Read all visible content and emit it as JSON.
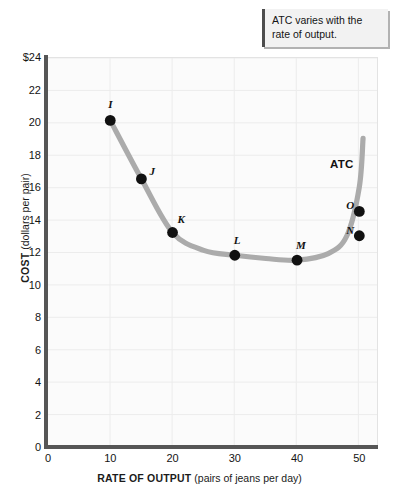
{
  "callout": {
    "text": "ATC varies with the rate of output."
  },
  "chart_data": {
    "type": "line",
    "title": "",
    "xlabel_strong": "RATE OF OUTPUT",
    "xlabel_rest": " (pairs of jeans per day)",
    "ylabel_strong": "COST",
    "ylabel_rest": " (dollars per pair)",
    "xlim": [
      0,
      53
    ],
    "ylim": [
      0,
      24
    ],
    "xticks": [
      "0",
      "10",
      "20",
      "30",
      "40",
      "50"
    ],
    "xtick_values": [
      0,
      10,
      20,
      30,
      40,
      50
    ],
    "yticks": [
      "$24",
      "22",
      "20",
      "18",
      "16",
      "14",
      "12",
      "10",
      "8",
      "6",
      "4",
      "2",
      "0"
    ],
    "ytick_values": [
      24,
      22,
      20,
      18,
      16,
      14,
      12,
      10,
      8,
      6,
      4,
      2,
      0
    ],
    "grid": true,
    "legend_position": "inline-curve-label",
    "series": [
      {
        "name": "ATC",
        "label": "ATC",
        "color": "#ababab",
        "points": [
          {
            "label": "I",
            "x": 10,
            "y": 20.1,
            "label_dx": -2,
            "label_dy": -14
          },
          {
            "label": "J",
            "x": 15,
            "y": 16.5,
            "label_dx": 8,
            "label_dy": -6
          },
          {
            "label": "K",
            "x": 20,
            "y": 13.2,
            "label_dx": 5,
            "label_dy": -12
          },
          {
            "label": "L",
            "x": 30,
            "y": 11.8,
            "label_dx": -1,
            "label_dy": -13
          },
          {
            "label": "M",
            "x": 40,
            "y": 11.5,
            "label_dx": -1,
            "label_dy": -13
          },
          {
            "label": "N",
            "x": 50,
            "y": 13.0,
            "label_dx": -13,
            "label_dy": -4
          },
          {
            "label": "O",
            "x": 50,
            "y": 14.5,
            "label_dx": -13,
            "label_dy": -4
          }
        ],
        "curve_path": [
          {
            "x": 10,
            "y": 20.1
          },
          {
            "x": 15,
            "y": 16.5
          },
          {
            "x": 20,
            "y": 13.2
          },
          {
            "x": 25,
            "y": 12.1
          },
          {
            "x": 30,
            "y": 11.8
          },
          {
            "x": 35,
            "y": 11.6
          },
          {
            "x": 40,
            "y": 11.5
          },
          {
            "x": 45,
            "y": 11.9
          },
          {
            "x": 48,
            "y": 13.0
          },
          {
            "x": 50,
            "y": 16.0
          },
          {
            "x": 50.6,
            "y": 19.0
          }
        ]
      }
    ]
  },
  "colors": {
    "curve": "#ababab",
    "marker": "#111111",
    "axis": "#565656",
    "grid": "#ececec",
    "plot_background": "#fbfbfb",
    "callout_background": "#f2f2f2",
    "callout_accent": "#4d4d4d"
  }
}
